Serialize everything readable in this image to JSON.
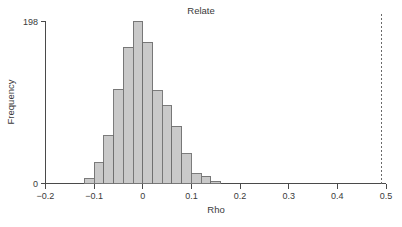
{
  "chart_data": {
    "type": "bar",
    "title": "Relate",
    "xlabel": "Rho",
    "ylabel": "Frequency",
    "xlim": [
      -0.24,
      0.52
    ],
    "ylim": [
      0,
      198
    ],
    "grid": false,
    "legend": "none",
    "xticks": [
      "-0.2",
      "-0.1",
      "0",
      "0.1",
      "0.2",
      "0.3",
      "0.4",
      "0.5"
    ],
    "xtick_values": [
      -0.2,
      -0.1,
      0,
      0.1,
      0.2,
      0.3,
      0.4,
      0.5
    ],
    "yticks": [
      "0",
      "198"
    ],
    "ytick_values": [
      0,
      198
    ],
    "bin_width": 0.02,
    "bin_starts": [
      -0.12,
      -0.1,
      -0.08,
      -0.06,
      -0.04,
      -0.02,
      0.0,
      0.02,
      0.04,
      0.06,
      0.08,
      0.1,
      0.12,
      0.14
    ],
    "categories": [
      "-0.12",
      "-0.10",
      "-0.08",
      "-0.06",
      "-0.04",
      "-0.02",
      "0.00",
      "0.02",
      "0.04",
      "0.06",
      "0.08",
      "0.10",
      "0.12",
      "0.14"
    ],
    "values": [
      6,
      25,
      58,
      115,
      166,
      198,
      172,
      113,
      95,
      70,
      36,
      12,
      9,
      3
    ],
    "annotations": [
      {
        "name": "observed-value-reference-line",
        "type": "vline",
        "x": 0.49,
        "style": "dashed"
      }
    ]
  },
  "figure": {
    "title": "Relate",
    "x_axis_title": "Rho",
    "y_axis_title": "Frequency"
  }
}
